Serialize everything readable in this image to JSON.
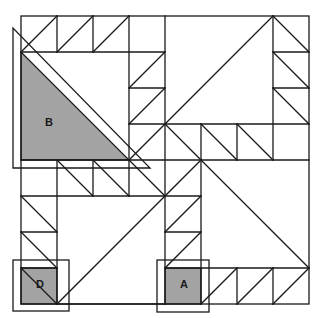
{
  "diagram": {
    "type": "quilt-block-pattern",
    "grid": {
      "cols": 8,
      "rows": 8
    },
    "colors": {
      "line": "#1a1a1a",
      "shade": "#a3a3a3",
      "background": "#ffffff"
    },
    "labels": {
      "B": "B",
      "D": "D",
      "A": "A"
    },
    "pieces": [
      {
        "id": "B",
        "shape": "right-triangle",
        "shaded": true,
        "label": "B"
      },
      {
        "id": "D",
        "shape": "square",
        "shaded": true,
        "label": "D",
        "has_outline_frame": true
      },
      {
        "id": "A",
        "shape": "square",
        "shaded": true,
        "label": "A",
        "has_outline_frame": true
      }
    ]
  }
}
